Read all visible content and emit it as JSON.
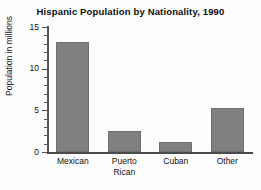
{
  "chart_data": {
    "type": "bar",
    "title": "Hispanic Population by Nationality, 1990",
    "xlabel": "",
    "ylabel": "Population in millions",
    "categories": [
      "Mexican",
      "Puerto Rican",
      "Cuban",
      "Other"
    ],
    "category_lines": [
      [
        "Mexican"
      ],
      [
        "Puerto",
        "Rican"
      ],
      [
        "Cuban"
      ],
      [
        "Other"
      ]
    ],
    "values": [
      13.2,
      2.5,
      1.2,
      5.3
    ],
    "ylim": [
      0,
      15
    ],
    "ytick_labels": [
      "0",
      "5",
      "10",
      "15"
    ],
    "ytick_values": [
      0,
      5,
      10,
      15
    ],
    "minor_tick_interval": 1,
    "grid": false,
    "legend": "none",
    "bar_color": "#808080",
    "axis_color": "#555555",
    "text_color": "#111111"
  }
}
